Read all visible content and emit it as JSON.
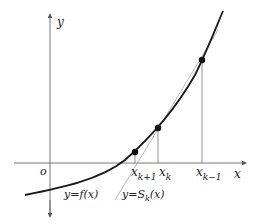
{
  "diagram": {
    "axes": {
      "x_label": "x",
      "y_label": "y",
      "origin_label": "o"
    },
    "points": [
      {
        "label_base": "x",
        "label_sub": "k+1",
        "x": 135,
        "y": 152
      },
      {
        "label_base": "x",
        "label_sub": "k",
        "x": 158,
        "y": 128
      },
      {
        "label_base": "x",
        "label_sub": "k−1",
        "x": 202,
        "y": 60
      }
    ],
    "curve_label": {
      "base": "y=f(x)"
    },
    "secant_label": {
      "pre": "y=S",
      "sub": "k",
      "post": "(x)"
    },
    "colors": {
      "curve": "#1a1a1a",
      "axes": "#555555",
      "secant": "#888888",
      "point": "#111111"
    }
  }
}
